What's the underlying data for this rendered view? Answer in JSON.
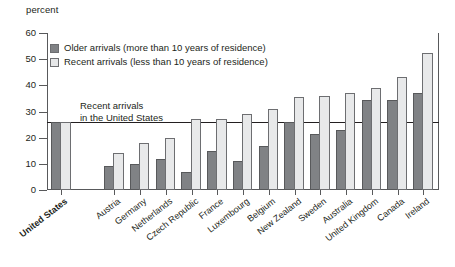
{
  "chart_data": {
    "type": "bar",
    "title": "",
    "subtitle": "",
    "xlabel": "",
    "ylabel": "percent",
    "ylim": [
      0,
      60
    ],
    "yticks": [
      0,
      10,
      20,
      30,
      40,
      50,
      60
    ],
    "grid": false,
    "legend_position": "top-left",
    "categories": [
      "United States",
      "Austria",
      "Germany",
      "Netherlands",
      "Czech Republic",
      "France",
      "Luxembourg",
      "Belgium",
      "New Zealand",
      "Sweden",
      "Australia",
      "United Kingdom",
      "Canada",
      "Ireland"
    ],
    "series": [
      {
        "name": "Older arrivals (more than 10 years of residence)",
        "color": "#808285",
        "values": [
          26,
          9,
          10,
          12,
          7,
          15,
          11,
          17,
          26,
          21.5,
          23,
          34.5,
          34.5,
          37
        ]
      },
      {
        "name": "Recent arrivals (less than 10 years of residence)",
        "color": "#e8e9ea",
        "values": [
          26,
          14,
          18,
          20,
          27,
          27,
          29,
          31,
          35.5,
          36,
          37,
          39,
          43,
          52.5
        ]
      }
    ],
    "annotations": [
      {
        "name": "us-reference-line",
        "text_line1": "Recent arrivals",
        "text_line2": "in the United States",
        "value": 26
      }
    ]
  },
  "legend": {
    "items": [
      {
        "label": "Older arrivals (more than 10 years of residence)",
        "swatch": "dark-gray-swatch"
      },
      {
        "label": "Recent arrivals (less than 10 years of residence)",
        "swatch": "light-gray-swatch"
      }
    ]
  },
  "axis": {
    "y_label": "percent",
    "y_ticks": [
      "60",
      "50",
      "40",
      "30",
      "20",
      "10",
      "0"
    ]
  },
  "colors": {
    "older_bar": "#808285",
    "recent_bar": "#e8e9ea",
    "axis": "#58595b",
    "text": "#231f20"
  }
}
